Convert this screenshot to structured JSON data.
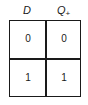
{
  "table": {
    "headers": [
      {
        "main": "D",
        "sub": ""
      },
      {
        "main": "Q",
        "sub": "+"
      }
    ],
    "rows": [
      [
        "0",
        "0"
      ],
      [
        "1",
        "1"
      ]
    ]
  }
}
